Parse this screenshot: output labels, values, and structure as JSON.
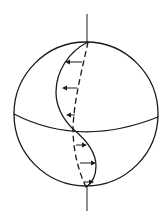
{
  "diagram": {
    "title": "",
    "colors": {
      "stroke": "#1a1a1a",
      "axis": "#333333",
      "background": "#ffffff"
    },
    "sphere": {
      "cx": 86,
      "cy": 114,
      "r": 72
    },
    "axis": {
      "top": {
        "x1": 87,
        "y1": 14,
        "x2": 87,
        "y2": 42
      },
      "bottom": {
        "x1": 87,
        "y1": 186,
        "x2": 87,
        "y2": 211
      }
    },
    "upper_arrows": [
      {
        "y": 62,
        "x_from": 82,
        "x_to": 66,
        "direction": "left"
      },
      {
        "y": 88,
        "x_from": 77,
        "x_to": 63,
        "direction": "left"
      },
      {
        "y": 115,
        "x_from": 75,
        "x_to": 67,
        "direction": "left"
      }
    ],
    "lower_arrows": [
      {
        "y": 145,
        "x_from": 76,
        "x_to": 86,
        "direction": "right"
      },
      {
        "y": 163,
        "x_from": 80,
        "x_to": 95,
        "direction": "right"
      },
      {
        "y": 183,
        "x_from": 85,
        "x_to": 93,
        "direction": "right"
      }
    ],
    "labels": []
  }
}
